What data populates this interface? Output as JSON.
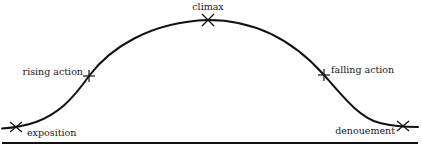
{
  "diagram": {
    "title": "",
    "type": "plot-structure-arc",
    "colors": {
      "line": "#111111",
      "text": "#1a1a1a",
      "background": "#ffffff"
    },
    "points": [
      {
        "id": "exposition",
        "label": "exposition",
        "x": 16,
        "y": 127
      },
      {
        "id": "rising-action",
        "label": "rising action",
        "x": 89,
        "y": 76
      },
      {
        "id": "climax",
        "label": "climax",
        "x": 208,
        "y": 20
      },
      {
        "id": "falling-action",
        "label": "falling action",
        "x": 324,
        "y": 75
      },
      {
        "id": "denouement",
        "label": "denouement",
        "x": 403,
        "y": 126
      }
    ],
    "baseline": {
      "x1": 2,
      "x2": 418,
      "y": 143
    }
  }
}
